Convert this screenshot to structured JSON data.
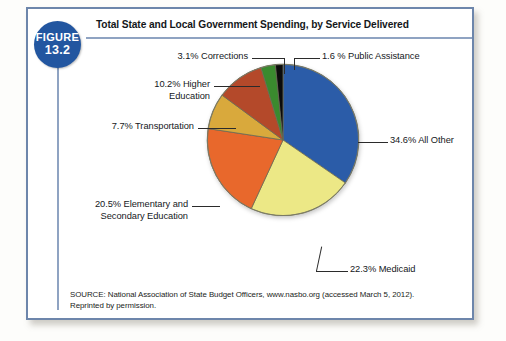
{
  "figure": {
    "badge_line1": "FIGURE",
    "badge_line2": "13.2",
    "title": "Total State and Local Government Spending, by Service Delivered",
    "source_line1": "SOURCE: National Association of State Budget Officers, www.nasbo.org (accessed March 5, 2012).",
    "source_line2": "Reprinted by permission."
  },
  "labels": {
    "corrections": "3.1% Corrections",
    "public_assistance": "1.6 % Public Assistance",
    "higher_education": "10.2% Higher\nEducation",
    "transportation": "7.7% Transportation",
    "elementary": "20.5% Elementary and\nSecondary Education",
    "medicaid": "22.3% Medicaid",
    "all_other": "34.6% All Other"
  },
  "chart_data": {
    "type": "pie",
    "title": "Total State and Local Government Spending, by Service Delivered",
    "unit": "percent",
    "legend": "none",
    "labels_position": "callout-leader-lines",
    "categories": [
      "All Other",
      "Medicaid",
      "Elementary and Secondary Education",
      "Transportation",
      "Higher Education",
      "Corrections",
      "Public Assistance"
    ],
    "values": [
      34.6,
      22.3,
      20.5,
      7.7,
      10.2,
      3.1,
      1.6
    ],
    "colors": [
      "#2b5ca8",
      "#ece886",
      "#e8682c",
      "#d9a93c",
      "#b4492a",
      "#3a8a2e",
      "#0b0b0b"
    ],
    "slice_labels": [
      "34.6% All Other",
      "22.3% Medicaid",
      "20.5% Elementary and Secondary Education",
      "7.7% Transportation",
      "10.2% Higher Education",
      "3.1% Corrections",
      "1.6 % Public Assistance"
    ],
    "total": 100.0,
    "start_angle_deg": 0,
    "direction": "clockwise"
  },
  "style": {
    "frame_border": "#6d86ab",
    "badge_bg": "#2256a0",
    "rule": "#8fa3c2"
  }
}
